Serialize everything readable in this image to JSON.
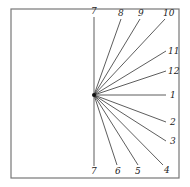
{
  "diagram": {
    "title": "",
    "frame": {
      "x": 11,
      "y": 9,
      "width": 168,
      "height": 169,
      "stroke": "#777777"
    },
    "origin": {
      "x": 94,
      "y": 95
    },
    "hour_lines": [
      {
        "label": "7",
        "x2": 94,
        "y2": 17,
        "lx": 91,
        "ly": 14
      },
      {
        "label": "8",
        "x2": 121,
        "y2": 19,
        "lx": 118,
        "ly": 16
      },
      {
        "label": "9",
        "x2": 140,
        "y2": 19,
        "lx": 138,
        "ly": 16
      },
      {
        "label": "10",
        "x2": 165,
        "y2": 19,
        "lx": 163,
        "ly": 16
      },
      {
        "label": "11",
        "x2": 166,
        "y2": 51,
        "lx": 168,
        "ly": 54
      },
      {
        "label": "12",
        "x2": 166,
        "y2": 71,
        "lx": 168,
        "ly": 74
      },
      {
        "label": "1",
        "x2": 166,
        "y2": 95,
        "lx": 170,
        "ly": 98
      },
      {
        "label": "2",
        "x2": 166,
        "y2": 122,
        "lx": 170,
        "ly": 125
      },
      {
        "label": "3",
        "x2": 166,
        "y2": 141,
        "lx": 170,
        "ly": 144
      },
      {
        "label": "4",
        "x2": 163,
        "y2": 165,
        "lx": 164,
        "ly": 173
      },
      {
        "label": "5",
        "x2": 138,
        "y2": 165,
        "lx": 135,
        "ly": 174
      },
      {
        "label": "6",
        "x2": 117,
        "y2": 165,
        "lx": 115,
        "ly": 174
      },
      {
        "label": "7",
        "x2": 94,
        "y2": 166,
        "lx": 91,
        "ly": 174
      }
    ]
  }
}
